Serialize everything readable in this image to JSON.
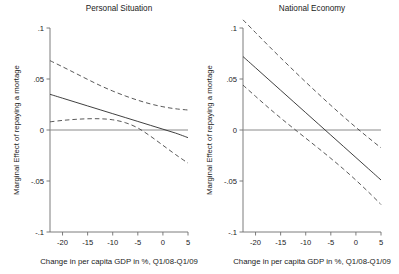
{
  "figure": {
    "width": 399,
    "height": 274,
    "background": "#ffffff",
    "line_color": "#2a2a2a",
    "ci_color": "#3a3a3a",
    "axis_color": "#6e6e6e"
  },
  "chart_data": [
    {
      "type": "line",
      "title": "Personal Situation",
      "xlabel": "Change in per capita GDP in %, Q1/08-Q1/09",
      "ylabel": "Marginal Effect of repaying a mortage",
      "xlim": [
        -22.5,
        5.0
      ],
      "ylim": [
        -0.1,
        0.1
      ],
      "xticks": [
        -20,
        -15,
        -10,
        -5,
        0,
        5
      ],
      "xticklabels": [
        "-20",
        "-15",
        "-10",
        "-5",
        "0",
        "5"
      ],
      "yticks": [
        -0.1,
        -0.05,
        0,
        0.05,
        0.1
      ],
      "yticklabels": [
        "-.1",
        "-.05",
        "0",
        ".05",
        ".1"
      ],
      "grid": false,
      "legend": "none",
      "reference_line": {
        "y": 0,
        "style": "solid"
      },
      "x": [
        -22.5,
        -20,
        -17.5,
        -15,
        -12.5,
        -10,
        -7.5,
        -5,
        -2.5,
        0,
        2.5,
        5
      ],
      "series": [
        {
          "name": "Marginal effect",
          "style": "solid",
          "values": [
            0.035,
            0.0312,
            0.0274,
            0.0236,
            0.0198,
            0.016,
            0.0122,
            0.0084,
            0.0046,
            0.0008,
            -0.003,
            -0.0075
          ]
        },
        {
          "name": "Upper 95% confidence bound",
          "style": "dashed",
          "values": [
            0.068,
            0.062,
            0.0558,
            0.0496,
            0.0436,
            0.0382,
            0.0334,
            0.0292,
            0.0256,
            0.0228,
            0.0208,
            0.0196
          ]
        },
        {
          "name": "Lower 95% confidence bound",
          "style": "dashed",
          "values": [
            0.008,
            0.0094,
            0.0104,
            0.011,
            0.011,
            0.01,
            0.0072,
            0.002,
            -0.006,
            -0.015,
            -0.024,
            -0.0325
          ]
        }
      ]
    },
    {
      "type": "line",
      "title": "National Economy",
      "xlabel": "Change in per capita GDP in %, Q1/08-Q1/09",
      "ylabel": "Marginal Effect of repaying a mortage",
      "xlim": [
        -22.5,
        5.0
      ],
      "ylim": [
        -0.1,
        0.1
      ],
      "xticks": [
        -20,
        -15,
        -10,
        -5,
        0,
        5
      ],
      "xticklabels": [
        "-20",
        "-15",
        "-10",
        "-5",
        "0",
        "5"
      ],
      "yticks": [
        -0.1,
        -0.05,
        0,
        0.05,
        0.1
      ],
      "yticklabels": [
        "-.1",
        "-.05",
        "0",
        ".05",
        ".1"
      ],
      "grid": false,
      "legend": "none",
      "reference_line": {
        "y": 0,
        "style": "solid"
      },
      "x": [
        -22.5,
        -20,
        -17.5,
        -15,
        -12.5,
        -10,
        -7.5,
        -5,
        -2.5,
        0,
        2.5,
        5
      ],
      "series": [
        {
          "name": "Marginal effect",
          "style": "solid",
          "values": [
            0.072,
            0.061,
            0.05,
            0.039,
            0.028,
            0.017,
            0.006,
            -0.005,
            -0.016,
            -0.027,
            -0.038,
            -0.049
          ]
        },
        {
          "name": "Upper 95% confidence bound",
          "style": "dashed",
          "values": [
            0.108,
            0.0955,
            0.083,
            0.0708,
            0.0588,
            0.047,
            0.0355,
            0.0242,
            0.0132,
            0.0026,
            -0.0076,
            -0.0175
          ]
        },
        {
          "name": "Lower 95% confidence bound",
          "style": "dashed",
          "values": [
            0.044,
            0.033,
            0.0222,
            0.0118,
            0.0018,
            -0.008,
            -0.0178,
            -0.0278,
            -0.0382,
            -0.0492,
            -0.0608,
            -0.073
          ]
        }
      ]
    }
  ]
}
